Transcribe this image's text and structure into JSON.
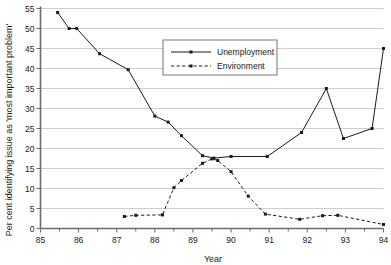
{
  "chart_data": {
    "type": "line",
    "title": "",
    "xlabel": "Year",
    "ylabel": "Per cent identifying issue as 'most important problem'",
    "xlim": [
      85,
      94
    ],
    "ylim": [
      0,
      55
    ],
    "ytick_step": 5,
    "grid": true,
    "legend_position": "top-center",
    "xticks": [
      "85",
      "86",
      "87",
      "88",
      "89",
      "90",
      "91",
      "92",
      "93",
      "94"
    ],
    "xtick_values": [
      85,
      86,
      87,
      88,
      89,
      90,
      91,
      92,
      93,
      94
    ],
    "yticks": [
      "0",
      "5",
      "10",
      "15",
      "20",
      "25",
      "30",
      "35",
      "40",
      "45",
      "50",
      "55"
    ],
    "ytick_values": [
      0,
      5,
      10,
      15,
      20,
      25,
      30,
      35,
      40,
      45,
      50,
      55
    ],
    "series": [
      {
        "name": "Unemployment",
        "style": "solid",
        "marker": "square",
        "points": [
          [
            85.45,
            54.0
          ],
          [
            85.75,
            50.0
          ],
          [
            85.95,
            50.0
          ],
          [
            86.55,
            43.7
          ],
          [
            87.3,
            39.7
          ],
          [
            88.0,
            28.1
          ],
          [
            88.35,
            26.6
          ],
          [
            88.7,
            23.2
          ],
          [
            89.25,
            18.2
          ],
          [
            89.55,
            17.6
          ],
          [
            90.0,
            18.0
          ],
          [
            90.95,
            18.0
          ],
          [
            91.85,
            24.0
          ],
          [
            92.5,
            35.0
          ],
          [
            92.95,
            22.5
          ],
          [
            93.7,
            25.0
          ],
          [
            94.0,
            45.0
          ]
        ]
      },
      {
        "name": "Environment",
        "style": "dashed",
        "marker": "square",
        "points": [
          [
            87.2,
            3.0
          ],
          [
            87.5,
            3.3
          ],
          [
            88.2,
            3.4
          ],
          [
            88.5,
            10.2
          ],
          [
            88.7,
            12.0
          ],
          [
            89.25,
            16.3
          ],
          [
            89.5,
            17.4
          ],
          [
            89.65,
            17.0
          ],
          [
            90.0,
            14.2
          ],
          [
            90.45,
            8.1
          ],
          [
            90.9,
            3.6
          ],
          [
            91.8,
            2.3
          ],
          [
            92.4,
            3.2
          ],
          [
            92.8,
            3.3
          ],
          [
            94.0,
            1.0
          ]
        ]
      }
    ]
  },
  "legend": {
    "entries": [
      {
        "label": "Unemployment",
        "style": "solid"
      },
      {
        "label": "Environment",
        "style": "dashed"
      }
    ]
  },
  "colors": {
    "line": "#1a1a1a",
    "grid": "#b9b9b9",
    "axis": "#6b6b6b",
    "background": "#ffffff"
  }
}
